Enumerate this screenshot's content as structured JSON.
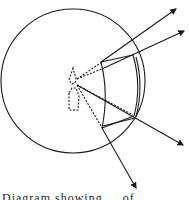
{
  "diagram": {
    "type": "optics-sphere-diagram",
    "elements": [
      "outer-circle",
      "light-source",
      "dashed-rays",
      "curved-screen",
      "outgoing-arrows"
    ],
    "colors": {
      "stroke": "#1a1a1a",
      "background": "#ffffff"
    }
  },
  "caption": "Diagram showing ... of ..."
}
